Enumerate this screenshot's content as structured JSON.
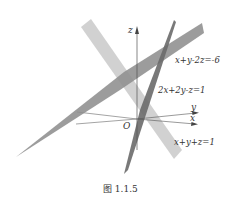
{
  "figure": {
    "caption": "图 1.1.5",
    "axes": {
      "z_label": "z",
      "y_label": "y",
      "x_label": "x",
      "origin_label": "O"
    },
    "planes": [
      {
        "equation": "x+y-2z=-6",
        "shade": "#8c8c8c"
      },
      {
        "equation": "2x+2y-z=1",
        "shade": "#6e6e6e"
      },
      {
        "equation": "x+y+z=1",
        "shade": "#c8c8c8"
      }
    ],
    "colors": {
      "axis": "#555555",
      "text": "#333333",
      "background": "#ffffff"
    }
  }
}
